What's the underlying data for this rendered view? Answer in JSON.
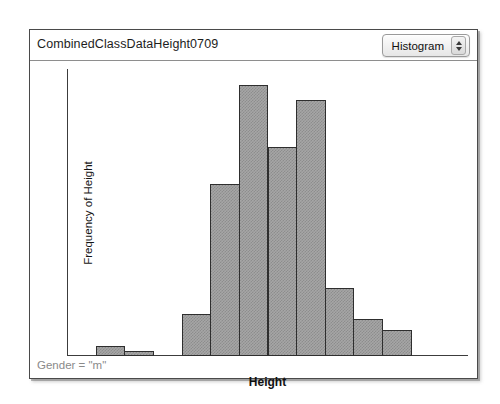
{
  "window": {
    "title": "CombinedClassDataHeight0709",
    "plot_type_selector": {
      "value": "Histogram",
      "stepper_up_icon": "triangle-up-icon",
      "stepper_down_icon": "triangle-down-icon"
    },
    "footer_note": "Gender = \"m\""
  },
  "chart_data": {
    "type": "bar",
    "title": "CombinedClassDataHeight0709",
    "xlabel": "Height",
    "ylabel": "Frequency of Height",
    "xlim": [
      140,
      210
    ],
    "ylim": [
      0,
      55
    ],
    "grid": false,
    "legend": null,
    "bin_width": 5,
    "x_ticks": [
      140,
      150,
      160,
      170,
      180,
      190,
      200,
      210
    ],
    "x_tick_labels": [
      "140",
      "150",
      "160",
      "170",
      "180",
      "190",
      "200",
      "21"
    ],
    "x_minor_tick_step": 5,
    "y_ticks": [
      10,
      20,
      30,
      40,
      50
    ],
    "y_tick_labels": [
      "10",
      "20",
      "30",
      "40",
      "50"
    ],
    "y_minor_tick_step": 5,
    "categories": [
      "145-150",
      "150-155",
      "160-165",
      "165-170",
      "170-175",
      "175-180",
      "180-185",
      "185-190",
      "190-195",
      "195-200"
    ],
    "bins": [
      {
        "start": 145,
        "end": 150,
        "count": 2
      },
      {
        "start": 150,
        "end": 155,
        "count": 1
      },
      {
        "start": 160,
        "end": 165,
        "count": 8
      },
      {
        "start": 165,
        "end": 170,
        "count": 33
      },
      {
        "start": 170,
        "end": 175,
        "count": 52
      },
      {
        "start": 175,
        "end": 180,
        "count": 40
      },
      {
        "start": 180,
        "end": 185,
        "count": 49
      },
      {
        "start": 185,
        "end": 190,
        "count": 13
      },
      {
        "start": 190,
        "end": 195,
        "count": 7
      },
      {
        "start": 195,
        "end": 200,
        "count": 5
      }
    ],
    "values": [
      2,
      1,
      8,
      33,
      52,
      40,
      49,
      13,
      7,
      5
    ],
    "colors": {
      "bar_fill": "#a6a6a6",
      "bar_edge": "#2e2e2e",
      "axis": "#3c3c3c",
      "plot_background": "#ffffff",
      "footer_text": "#8a8a8a"
    }
  }
}
